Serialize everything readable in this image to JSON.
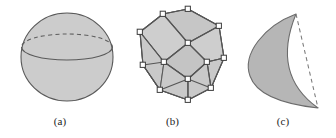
{
  "figure": {
    "background_color": "#ffffff",
    "panels": [
      {
        "key": "a",
        "caption": "(a)",
        "shape_name": "sphere-with-equator",
        "description": "Shaded sphere with equator ellipse, dashed on the far half and solid on the near half",
        "fill_color": "#cccccc",
        "stroke_color": "#595959",
        "geometry": {
          "center_x": 67,
          "center_y": 57,
          "radius_x": 46,
          "radius_y": 44,
          "equator_y": 47,
          "equator_radius_y": 13
        }
      },
      {
        "key": "b",
        "caption": "(b)",
        "shape_name": "cuboctahedron-polyhedron",
        "description": "Shaded convex polyhedron (cuboctahedron) drawn with visible edges and small square vertex markers",
        "fill_color": "#cccccc",
        "stroke_color": "#5a5a5a",
        "vertex_marker_fill": "#ffffff",
        "vertex_marker_stroke": "#404040",
        "vertex_count": 12
      },
      {
        "key": "c",
        "caption": "(c)",
        "shape_name": "crescent-lune-with-chord",
        "description": "Shaded crescent (lune) region with a dashed chord connecting the two cusp tips",
        "fill_color": "#b4b4b4",
        "stroke_color": "#6b6b6b",
        "dashed_chord_color": "#787878",
        "geometry": {
          "top_tip_x": 296,
          "top_tip_y": 14,
          "bottom_tip_x": 318,
          "bottom_tip_y": 108
        }
      }
    ]
  }
}
